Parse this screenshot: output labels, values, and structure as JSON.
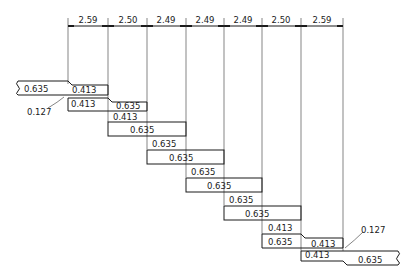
{
  "diagram": {
    "type": "stepped-lap-joint-dimension-drawing",
    "dimensions_top": [
      "2.59",
      "2.50",
      "2.49",
      "2.49",
      "2.49",
      "2.50",
      "2.59"
    ],
    "rows": [
      {
        "left": "0.635",
        "right": "0.413"
      },
      {
        "left": "0.413",
        "right": "0.635"
      },
      {
        "gap": "0.413",
        "box": "0.635"
      },
      {
        "gap": "0.635",
        "box": "0.635"
      },
      {
        "gap": "0.635",
        "box": "0.635"
      },
      {
        "gap": "0.635",
        "box": "0.635"
      },
      {
        "gap": "0.413",
        "left": "0.635",
        "right": "0.413"
      },
      {
        "left": "0.413",
        "right": "0.635"
      }
    ],
    "callouts": {
      "top_left": "0.127",
      "bottom_right": "0.127"
    }
  }
}
